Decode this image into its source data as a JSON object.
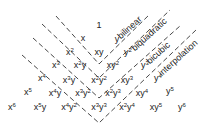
{
  "diagram": {
    "title": "",
    "line_color": "#333333",
    "terms": [
      {
        "name": "term-1",
        "base": "1",
        "x": 99,
        "y": 25
      },
      {
        "name": "term-x",
        "base": "x",
        "x": 83,
        "y": 38
      },
      {
        "name": "term-y",
        "base": "y",
        "x": 117,
        "y": 39
      },
      {
        "name": "term-x2",
        "base": "x",
        "sup": "2",
        "x": 70,
        "y": 52
      },
      {
        "name": "term-xy",
        "base": "xy",
        "x": 99,
        "y": 52
      },
      {
        "name": "term-y2",
        "base": "y",
        "sup": "2",
        "x": 128,
        "y": 52
      },
      {
        "name": "term-x3",
        "base": "x",
        "sup": "3",
        "x": 56,
        "y": 65
      },
      {
        "name": "term-x2y",
        "base": "x",
        "sup": "2",
        "tail": "y",
        "x": 80,
        "y": 65
      },
      {
        "name": "term-xy2",
        "base": "xy",
        "sup": "2",
        "x": 113,
        "y": 65
      },
      {
        "name": "term-y3",
        "base": "y",
        "sup": "3",
        "x": 145,
        "y": 65
      },
      {
        "name": "term-x4",
        "base": "x",
        "sup": "4",
        "x": 42,
        "y": 78
      },
      {
        "name": "term-x3y",
        "base": "x",
        "sup": "3",
        "tail": "y",
        "x": 69,
        "y": 80
      },
      {
        "name": "term-x2y2",
        "base": "x",
        "sup": "2",
        "tail": "y",
        "tailsup": "2",
        "x": 99,
        "y": 80
      },
      {
        "name": "term-xy3",
        "base": "xy",
        "sup": "3",
        "x": 127,
        "y": 80
      },
      {
        "name": "term-y4",
        "base": "y",
        "sup": "4",
        "x": 158,
        "y": 78
      },
      {
        "name": "term-x5",
        "base": "x",
        "sup": "5",
        "x": 28,
        "y": 92
      },
      {
        "name": "term-x4y",
        "base": "x",
        "sup": "4",
        "tail": "y",
        "x": 55,
        "y": 93
      },
      {
        "name": "term-x3y2",
        "base": "x",
        "sup": "3",
        "tail": "y",
        "tailsup": "2",
        "x": 83,
        "y": 93
      },
      {
        "name": "term-x2y3",
        "base": "x",
        "sup": "2",
        "tail": "y",
        "tailsup": "3",
        "x": 113,
        "y": 93
      },
      {
        "name": "term-xy4",
        "base": "xy",
        "sup": "4",
        "x": 142,
        "y": 93
      },
      {
        "name": "term-y5",
        "base": "y",
        "sup": "5",
        "x": 170,
        "y": 91
      },
      {
        "name": "term-x6",
        "base": "x",
        "sup": "6",
        "x": 12,
        "y": 107
      },
      {
        "name": "term-x5y",
        "base": "x",
        "sup": "5",
        "tail": "y",
        "x": 40,
        "y": 107
      },
      {
        "name": "term-x4y2",
        "base": "x",
        "sup": "4",
        "tail": "y",
        "tailsup": "2",
        "x": 69,
        "y": 107
      },
      {
        "name": "term-x3y3",
        "base": "x",
        "sup": "3",
        "tail": "y",
        "tailsup": "3",
        "x": 99,
        "y": 107
      },
      {
        "name": "term-x2y4",
        "base": "x",
        "sup": "2",
        "tail": "y",
        "tailsup": "4",
        "x": 127,
        "y": 107
      },
      {
        "name": "term-xy5",
        "base": "xy",
        "sup": "5",
        "x": 156,
        "y": 107
      },
      {
        "name": "term-y6",
        "base": "y",
        "sup": "6",
        "x": 182,
        "y": 107
      }
    ],
    "regions": [
      {
        "name": "bilinear",
        "label": "bilinear",
        "vx": 99,
        "vy": 64,
        "left": [
          56,
          16
        ],
        "right": [
          150,
          14
        ],
        "lx": 122,
        "ly": 41
      },
      {
        "name": "biquadratic",
        "label": "biquadratic",
        "vx": 99,
        "vy": 78,
        "left": [
          42,
          24
        ],
        "right": [
          170,
          10
        ],
        "lx": 136,
        "ly": 53
      },
      {
        "name": "bicubic",
        "label": "bicubic",
        "vx": 99,
        "vy": 98,
        "left": [
          33,
          38
        ],
        "right": [
          180,
          26
        ],
        "lx": 151,
        "ly": 66
      },
      {
        "name": "interpolation",
        "label": "interpolation",
        "vx": 99,
        "vy": 123,
        "left": [
          22,
          55
        ],
        "right": [
          196,
          30
        ],
        "lx": 163,
        "ly": 78
      }
    ]
  }
}
